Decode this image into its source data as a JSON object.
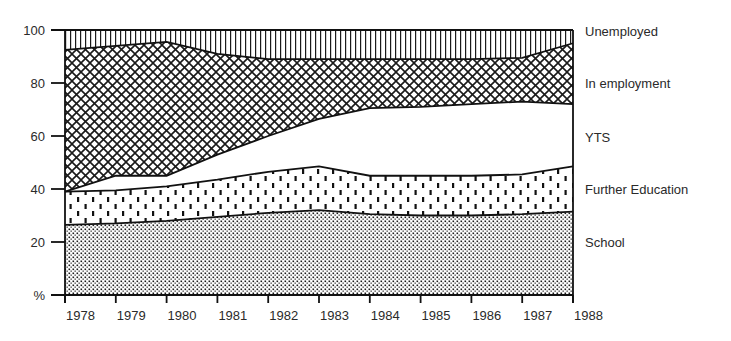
{
  "chart_data": {
    "type": "area",
    "stacked": true,
    "title": "",
    "xlabel": "",
    "ylabel": "%",
    "ylim": [
      0,
      100
    ],
    "yticks": [
      0,
      20,
      40,
      60,
      80,
      100
    ],
    "ytick_labels": [
      "%",
      "20",
      "40",
      "60",
      "80",
      "100"
    ],
    "x": [
      1978,
      1979,
      1980,
      1981,
      1982,
      1983,
      1984,
      1985,
      1986,
      1987,
      1988
    ],
    "xtick_labels": [
      "1978",
      "1979",
      "1980",
      "1981",
      "1982",
      "1983",
      "1984",
      "1985",
      "1986",
      "1987",
      "1988"
    ],
    "grid": false,
    "legend_position": "right (inline labels)",
    "series": [
      {
        "name": "School",
        "pattern": "fine-dots",
        "values": [
          26.5,
          27,
          28,
          29.5,
          31,
          32,
          30.5,
          30,
          30,
          30.5,
          31.5
        ]
      },
      {
        "name": "Further Education",
        "pattern": "dashes",
        "values": [
          12.5,
          12.5,
          13,
          14,
          15.5,
          16.5,
          14.5,
          15,
          15,
          15,
          17
        ]
      },
      {
        "name": "YTS",
        "pattern": "blank",
        "values": [
          0,
          5.5,
          4,
          9.5,
          13.5,
          18,
          25.5,
          26,
          27,
          27.5,
          23.5
        ]
      },
      {
        "name": "In employment",
        "pattern": "crosshatch",
        "values": [
          53.5,
          49,
          50.5,
          38,
          29,
          22.5,
          18.5,
          18,
          17,
          16.5,
          23
        ]
      },
      {
        "name": "Unemployed",
        "pattern": "vertical-lines",
        "values": [
          7.5,
          6,
          4.5,
          9,
          11,
          11,
          11,
          11,
          11,
          10.5,
          5
        ]
      }
    ]
  },
  "legend": {
    "labels": [
      "Unemployed",
      "In employment",
      "YTS",
      "Further Education",
      "School"
    ]
  }
}
